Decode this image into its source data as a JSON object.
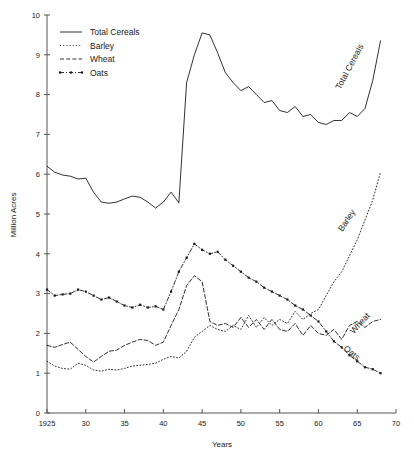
{
  "chart_data": {
    "type": "line",
    "title": "",
    "xlabel": "Years",
    "ylabel": "Million Acres",
    "xlim": [
      1925,
      1970
    ],
    "ylim": [
      0,
      10
    ],
    "grid": false,
    "legend_position": "top-left",
    "x_ticks": [
      "1925",
      "30",
      "35",
      "40",
      "45",
      "50",
      "55",
      "60",
      "65",
      "70"
    ],
    "x_tick_values": [
      1925,
      1930,
      1935,
      1940,
      1945,
      1950,
      1955,
      1960,
      1965,
      1970
    ],
    "y_ticks": [
      "0",
      "1",
      "2",
      "3",
      "4",
      "5",
      "6",
      "7",
      "8",
      "9",
      "10"
    ],
    "y_tick_values": [
      0,
      1,
      2,
      3,
      4,
      5,
      6,
      7,
      8,
      9,
      10
    ],
    "x": [
      1925,
      1926,
      1927,
      1928,
      1929,
      1930,
      1931,
      1932,
      1933,
      1934,
      1935,
      1936,
      1937,
      1938,
      1939,
      1940,
      1941,
      1942,
      1943,
      1944,
      1945,
      1946,
      1947,
      1948,
      1949,
      1950,
      1951,
      1952,
      1953,
      1954,
      1955,
      1956,
      1957,
      1958,
      1959,
      1960,
      1961,
      1962,
      1963,
      1964,
      1965,
      1966,
      1967,
      1968
    ],
    "series": [
      {
        "name": "Total Cereals",
        "style": "solid",
        "marker": "none",
        "inline_label": "Total Cereals",
        "values": [
          6.2,
          6.05,
          5.98,
          5.95,
          5.88,
          5.9,
          5.55,
          5.3,
          5.27,
          5.3,
          5.38,
          5.45,
          5.42,
          5.3,
          5.15,
          5.3,
          5.55,
          5.28,
          8.3,
          9.0,
          9.55,
          9.5,
          9.05,
          8.55,
          8.3,
          8.1,
          8.2,
          8.0,
          7.8,
          7.85,
          7.6,
          7.55,
          7.7,
          7.45,
          7.5,
          7.3,
          7.25,
          7.35,
          7.35,
          7.55,
          7.45,
          7.65,
          8.35,
          9.35
        ]
      },
      {
        "name": "Barley",
        "style": "dotted",
        "marker": "none",
        "inline_label": "Barley",
        "values": [
          1.3,
          1.18,
          1.12,
          1.1,
          1.25,
          1.2,
          1.08,
          1.05,
          1.1,
          1.08,
          1.12,
          1.18,
          1.2,
          1.22,
          1.25,
          1.35,
          1.42,
          1.38,
          1.55,
          1.9,
          2.05,
          2.2,
          2.1,
          2.05,
          2.2,
          2.1,
          2.45,
          2.15,
          2.4,
          2.2,
          2.35,
          2.25,
          2.55,
          2.35,
          2.5,
          2.6,
          2.95,
          3.3,
          3.55,
          3.95,
          4.35,
          4.85,
          5.35,
          6.05
        ]
      },
      {
        "name": "Wheat",
        "style": "dashed",
        "marker": "none",
        "inline_label": "Wheat",
        "values": [
          1.7,
          1.65,
          1.72,
          1.78,
          1.6,
          1.42,
          1.28,
          1.42,
          1.55,
          1.58,
          1.7,
          1.78,
          1.85,
          1.82,
          1.7,
          1.78,
          2.2,
          2.6,
          3.2,
          3.45,
          3.3,
          2.3,
          2.2,
          2.25,
          2.15,
          2.4,
          2.15,
          2.35,
          2.1,
          2.35,
          2.1,
          2.05,
          2.25,
          1.95,
          2.2,
          2.0,
          1.95,
          2.1,
          1.85,
          2.2,
          2.3,
          2.15,
          2.3,
          2.35
        ]
      },
      {
        "name": "Oats",
        "style": "dashdot",
        "marker": "square",
        "inline_label": "Oats",
        "values": [
          3.1,
          2.95,
          2.98,
          3.0,
          3.1,
          3.05,
          2.95,
          2.85,
          2.9,
          2.8,
          2.7,
          2.65,
          2.72,
          2.65,
          2.68,
          2.6,
          3.05,
          3.55,
          3.9,
          4.25,
          4.1,
          4.0,
          4.05,
          3.85,
          3.7,
          3.55,
          3.4,
          3.3,
          3.15,
          3.05,
          2.95,
          2.85,
          2.7,
          2.6,
          2.45,
          2.3,
          2.05,
          1.8,
          1.65,
          1.45,
          1.3,
          1.15,
          1.1,
          1.0
        ]
      }
    ]
  },
  "legend": {
    "entries": [
      {
        "label": "Total Cereals",
        "style": "solid"
      },
      {
        "label": "Barley",
        "style": "dotted"
      },
      {
        "label": "Wheat",
        "style": "dashed"
      },
      {
        "label": "Oats",
        "style": "dashdot"
      }
    ]
  },
  "caption": {
    "text": ""
  }
}
